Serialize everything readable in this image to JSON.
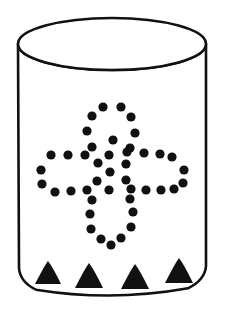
{
  "figure": {
    "colors": {
      "background": "#ffffff",
      "ink": "#111111",
      "fill": "#ffffff"
    }
  },
  "vessel": {
    "name": "cylindrical-vessel",
    "stroke_width": 2.6,
    "rim": {
      "name": "vessel-rim-ellipse",
      "center_x": 112,
      "center_y": 44,
      "radius_x": 94,
      "radius_y": 26
    },
    "body": {
      "name": "vessel-body",
      "left_x": 18,
      "right_x": 206,
      "top_y": 44,
      "bottom_y": 282,
      "bottom_curve_depth": 14
    }
  },
  "base_triangles": {
    "name": "base-triangle-row",
    "count": 4,
    "items": [
      {
        "cx": 48,
        "base_y": 284,
        "half_width": 13,
        "height": 23
      },
      {
        "cx": 89,
        "base_y": 288,
        "half_width": 14,
        "height": 25
      },
      {
        "cx": 135,
        "base_y": 289,
        "half_width": 14,
        "height": 25
      },
      {
        "cx": 179,
        "base_y": 283,
        "half_width": 14,
        "height": 25
      }
    ]
  },
  "motif": {
    "name": "dotted-cross-motif",
    "shape": "four-lobed cross / quatrefoil",
    "dot_count": 43,
    "dot_radius": 4.6,
    "center_x": 112,
    "center_y": 172,
    "dots": [
      {
        "cx": 103,
        "cy": 107
      },
      {
        "cx": 121,
        "cy": 107
      },
      {
        "cx": 92,
        "cy": 116
      },
      {
        "cx": 131,
        "cy": 117
      },
      {
        "cx": 87,
        "cy": 131
      },
      {
        "cx": 135,
        "cy": 133
      },
      {
        "cx": 92,
        "cy": 147
      },
      {
        "cx": 130,
        "cy": 148
      },
      {
        "cx": 68,
        "cy": 155
      },
      {
        "cx": 51,
        "cy": 155
      },
      {
        "cx": 85,
        "cy": 155
      },
      {
        "cx": 109,
        "cy": 155
      },
      {
        "cx": 127,
        "cy": 152
      },
      {
        "cx": 144,
        "cy": 153
      },
      {
        "cx": 160,
        "cy": 154
      },
      {
        "cx": 172,
        "cy": 157
      },
      {
        "cx": 41,
        "cy": 170
      },
      {
        "cx": 98,
        "cy": 163
      },
      {
        "cx": 126,
        "cy": 164
      },
      {
        "cx": 184,
        "cy": 170
      },
      {
        "cx": 42,
        "cy": 184
      },
      {
        "cx": 97,
        "cy": 181
      },
      {
        "cx": 126,
        "cy": 180
      },
      {
        "cx": 183,
        "cy": 183
      },
      {
        "cx": 55,
        "cy": 192
      },
      {
        "cx": 71,
        "cy": 191
      },
      {
        "cx": 87,
        "cy": 190
      },
      {
        "cx": 109,
        "cy": 190
      },
      {
        "cx": 131,
        "cy": 189
      },
      {
        "cx": 146,
        "cy": 190
      },
      {
        "cx": 161,
        "cy": 190
      },
      {
        "cx": 174,
        "cy": 189
      },
      {
        "cx": 92,
        "cy": 200
      },
      {
        "cx": 130,
        "cy": 199
      },
      {
        "cx": 90,
        "cy": 214
      },
      {
        "cx": 133,
        "cy": 212
      },
      {
        "cx": 91,
        "cy": 229
      },
      {
        "cx": 131,
        "cy": 227
      },
      {
        "cx": 101,
        "cy": 239
      },
      {
        "cx": 121,
        "cy": 238
      },
      {
        "cx": 111,
        "cy": 245
      },
      {
        "cx": 110,
        "cy": 172
      },
      {
        "cx": 113,
        "cy": 140
      }
    ]
  }
}
